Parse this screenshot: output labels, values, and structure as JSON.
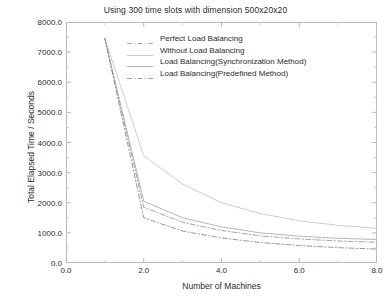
{
  "chart_data": {
    "type": "line",
    "title": "Using 300 time slots with dimension 500x20x20",
    "xlabel": "Number of Machines",
    "ylabel": "Total Elapsed Time / Seconds",
    "xlim": [
      0.0,
      8.0
    ],
    "ylim": [
      0.0,
      8000.0
    ],
    "xticks": [
      "0.0",
      "2.0",
      "4.0",
      "6.0",
      "8.0"
    ],
    "xtick_values": [
      0.0,
      2.0,
      4.0,
      6.0,
      8.0
    ],
    "yticks": [
      "0.0",
      "1000.0",
      "2000.0",
      "3000.0",
      "4000.0",
      "5000.0",
      "6000.0",
      "7000.0",
      "8000.0"
    ],
    "ytick_values": [
      0,
      1000,
      2000,
      3000,
      4000,
      5000,
      6000,
      7000,
      8000
    ],
    "grid": false,
    "legend_position": "upper center",
    "x": [
      1,
      2,
      3,
      4,
      5,
      6,
      7,
      8
    ],
    "series": [
      {
        "name": "Perfect Load Balancing",
        "style": "dashdot",
        "color": "#9a9a9a",
        "values": [
          7450,
          1850,
          1350,
          1080,
          900,
          800,
          730,
          690
        ]
      },
      {
        "name": "Without Load Balancing",
        "style": "solid",
        "color": "#c6c6c6",
        "values": [
          7450,
          3560,
          2620,
          2000,
          1640,
          1400,
          1250,
          1150
        ]
      },
      {
        "name": "Load Balancing(Synchronization Method)",
        "style": "solid",
        "color": "#aeaeae",
        "values": [
          7450,
          2050,
          1500,
          1200,
          1000,
          890,
          820,
          780
        ]
      },
      {
        "name": "Load Balancing(Predefined Method)",
        "style": "dashdot",
        "color": "#8f8f8f",
        "values": [
          7450,
          1500,
          1060,
          830,
          680,
          580,
          510,
          460
        ]
      }
    ]
  },
  "legend": {
    "items": [
      {
        "label": "Perfect Load Balancing"
      },
      {
        "label": "Without Load Balancing"
      },
      {
        "label": "Load Balancing(Synchronization Method)"
      },
      {
        "label": "Load Balancing(Predefined Method)"
      }
    ]
  }
}
